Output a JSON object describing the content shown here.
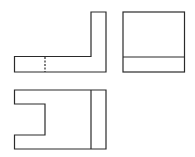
{
  "diagram": {
    "type": "orthographic-projection",
    "stroke_color": "#2a2a2a",
    "background": "#ffffff",
    "views": [
      {
        "name": "front-view",
        "shape": "L-shape",
        "hidden_line": true
      },
      {
        "name": "side-view",
        "shape": "rectangle-with-horizontal-line"
      },
      {
        "name": "top-view",
        "shape": "notched-rectangle-with-vertical-line"
      }
    ]
  }
}
